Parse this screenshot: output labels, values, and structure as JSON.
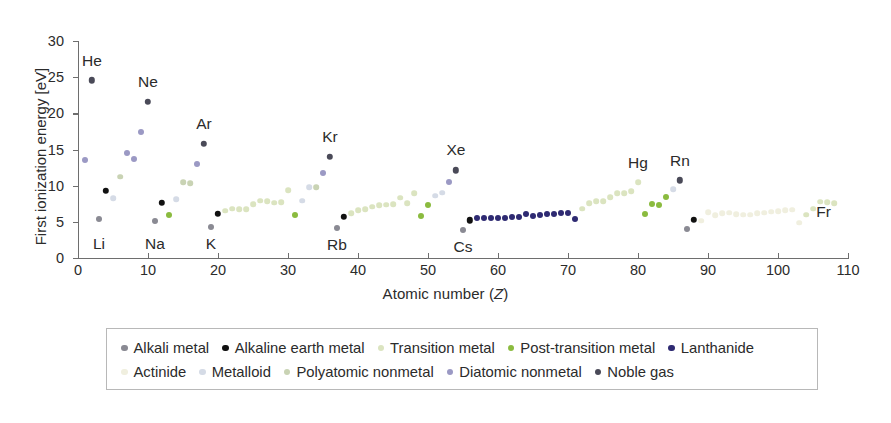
{
  "chart_data": {
    "type": "scatter",
    "title": "",
    "xlabel": "Atomic number (Z)",
    "ylabel": "First ionization energy [eV]",
    "xlim": [
      0,
      110
    ],
    "ylim": [
      0,
      30
    ],
    "xticks": [
      0,
      10,
      20,
      30,
      40,
      50,
      60,
      70,
      80,
      90,
      100,
      110
    ],
    "yticks": [
      0,
      5,
      10,
      15,
      20,
      25,
      30
    ],
    "grid": false,
    "legend_position": "below-axes",
    "category_colors": {
      "alkali-metal": "#8a8a93",
      "alkaline-earth-metal": "#111111",
      "transition-metal": "#dbe4c0",
      "post-transition-metal": "#8bbb3f",
      "lanthanide": "#2e2a72",
      "actinide": "#f0efdf",
      "metalloid": "#d5dbe6",
      "polyatomic-nonmetal": "#c9d3b4",
      "diatomic-nonmetal": "#9b99c4",
      "noble-gas": "#4a4a58"
    },
    "series": [
      {
        "name": "Alkali metal",
        "key": "alkali-metal",
        "points": [
          [
            3,
            5.39
          ],
          [
            11,
            5.14
          ],
          [
            19,
            4.34
          ],
          [
            37,
            4.18
          ],
          [
            55,
            3.89
          ],
          [
            87,
            4.07
          ]
        ]
      },
      {
        "name": "Alkaline earth metal",
        "key": "alkaline-earth-metal",
        "points": [
          [
            4,
            9.32
          ],
          [
            12,
            7.65
          ],
          [
            20,
            6.11
          ],
          [
            38,
            5.69
          ],
          [
            56,
            5.21
          ],
          [
            88,
            5.28
          ]
        ]
      },
      {
        "name": "Transition metal",
        "key": "transition-metal",
        "points": [
          [
            21,
            6.56
          ],
          [
            22,
            6.83
          ],
          [
            23,
            6.75
          ],
          [
            24,
            6.77
          ],
          [
            25,
            7.43
          ],
          [
            26,
            7.9
          ],
          [
            27,
            7.88
          ],
          [
            28,
            7.64
          ],
          [
            29,
            7.73
          ],
          [
            30,
            9.39
          ],
          [
            39,
            6.22
          ],
          [
            40,
            6.63
          ],
          [
            41,
            6.76
          ],
          [
            42,
            7.09
          ],
          [
            43,
            7.28
          ],
          [
            44,
            7.36
          ],
          [
            45,
            7.46
          ],
          [
            46,
            8.34
          ],
          [
            47,
            7.58
          ],
          [
            48,
            8.99
          ],
          [
            72,
            6.83
          ],
          [
            73,
            7.55
          ],
          [
            74,
            7.86
          ],
          [
            75,
            7.83
          ],
          [
            76,
            8.44
          ],
          [
            77,
            8.97
          ],
          [
            78,
            8.96
          ],
          [
            79,
            9.23
          ],
          [
            80,
            10.44
          ],
          [
            104,
            6.0
          ],
          [
            105,
            6.8
          ],
          [
            106,
            7.8
          ],
          [
            107,
            7.7
          ],
          [
            108,
            7.6
          ]
        ]
      },
      {
        "name": "Post-transition metal",
        "key": "post-transition-metal",
        "points": [
          [
            13,
            5.99
          ],
          [
            31,
            6.0
          ],
          [
            49,
            5.79
          ],
          [
            50,
            7.34
          ],
          [
            81,
            6.11
          ],
          [
            82,
            7.42
          ],
          [
            83,
            7.29
          ],
          [
            84,
            8.41
          ],
          [
            113,
            7.3
          ]
        ]
      },
      {
        "name": "Lanthanide",
        "key": "lanthanide",
        "points": [
          [
            57,
            5.58
          ],
          [
            58,
            5.54
          ],
          [
            59,
            5.47
          ],
          [
            60,
            5.53
          ],
          [
            61,
            5.58
          ],
          [
            62,
            5.64
          ],
          [
            63,
            5.67
          ],
          [
            64,
            6.15
          ],
          [
            65,
            5.86
          ],
          [
            66,
            5.94
          ],
          [
            67,
            6.02
          ],
          [
            68,
            6.11
          ],
          [
            69,
            6.18
          ],
          [
            70,
            6.25
          ],
          [
            71,
            5.43
          ]
        ]
      },
      {
        "name": "Actinide",
        "key": "actinide",
        "points": [
          [
            89,
            5.17
          ],
          [
            90,
            6.31
          ],
          [
            91,
            5.89
          ],
          [
            92,
            6.19
          ],
          [
            93,
            6.27
          ],
          [
            94,
            6.03
          ],
          [
            95,
            5.97
          ],
          [
            96,
            5.99
          ],
          [
            97,
            6.2
          ],
          [
            98,
            6.28
          ],
          [
            99,
            6.42
          ],
          [
            100,
            6.5
          ],
          [
            101,
            6.58
          ],
          [
            102,
            6.65
          ],
          [
            103,
            4.9
          ]
        ]
      },
      {
        "name": "Metalloid",
        "key": "metalloid",
        "points": [
          [
            5,
            8.3
          ],
          [
            14,
            8.15
          ],
          [
            32,
            7.9
          ],
          [
            33,
            9.79
          ],
          [
            51,
            8.61
          ],
          [
            52,
            9.01
          ],
          [
            85,
            9.5
          ]
        ]
      },
      {
        "name": "Polyatomic nonmetal",
        "key": "polyatomic-nonmetal",
        "points": [
          [
            6,
            11.26
          ],
          [
            15,
            10.49
          ],
          [
            16,
            10.36
          ],
          [
            34,
            9.75
          ]
        ]
      },
      {
        "name": "Diatomic nonmetal",
        "key": "diatomic-nonmetal",
        "points": [
          [
            1,
            13.6
          ],
          [
            7,
            14.53
          ],
          [
            8,
            13.62
          ],
          [
            9,
            17.42
          ],
          [
            17,
            12.97
          ],
          [
            35,
            11.81
          ],
          [
            53,
            10.45
          ]
        ]
      },
      {
        "name": "Noble gas",
        "key": "noble-gas",
        "points": [
          [
            2,
            24.59
          ],
          [
            10,
            21.56
          ],
          [
            18,
            15.76
          ],
          [
            36,
            14.0
          ],
          [
            54,
            12.13
          ],
          [
            86,
            10.75
          ]
        ]
      }
    ],
    "annotations": [
      {
        "text": "He",
        "x": 2,
        "y": 27.3
      },
      {
        "text": "Ne",
        "x": 10,
        "y": 24.3
      },
      {
        "text": "Ar",
        "x": 18,
        "y": 18.5
      },
      {
        "text": "Kr",
        "x": 36,
        "y": 16.7
      },
      {
        "text": "Xe",
        "x": 54,
        "y": 14.9
      },
      {
        "text": "Hg",
        "x": 80,
        "y": 13.1
      },
      {
        "text": "Rn",
        "x": 86,
        "y": 13.4
      },
      {
        "text": "Li",
        "x": 3,
        "y": 2.0
      },
      {
        "text": "Na",
        "x": 11,
        "y": 2.0
      },
      {
        "text": "K",
        "x": 19,
        "y": 2.0
      },
      {
        "text": "Rb",
        "x": 37,
        "y": 1.8
      },
      {
        "text": "Cs",
        "x": 55,
        "y": 1.5
      },
      {
        "text": "Fr",
        "x": 106.5,
        "y": 6.4
      }
    ]
  },
  "legend": {
    "rows": [
      [
        {
          "label": "Alkali metal",
          "key": "alkali-metal"
        },
        {
          "label": "Alkaline earth metal",
          "key": "alkaline-earth-metal"
        },
        {
          "label": "Transition metal",
          "key": "transition-metal"
        },
        {
          "label": "Post-transition metal",
          "key": "post-transition-metal"
        },
        {
          "label": "Lanthanide",
          "key": "lanthanide"
        }
      ],
      [
        {
          "label": "Actinide",
          "key": "actinide"
        },
        {
          "label": "Metalloid",
          "key": "metalloid"
        },
        {
          "label": "Polyatomic nonmetal",
          "key": "polyatomic-nonmetal"
        },
        {
          "label": "Diatomic nonmetal",
          "key": "diatomic-nonmetal"
        },
        {
          "label": "Noble gas",
          "key": "noble-gas"
        }
      ]
    ]
  }
}
